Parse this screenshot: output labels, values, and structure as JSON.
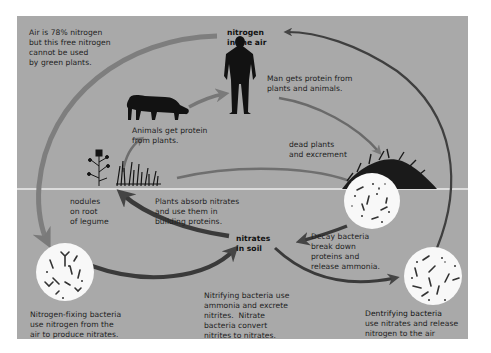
{
  "colors": {
    "panel_background": "#a9a9a9",
    "arrow_dark": "#4a4a4a",
    "arrow_light": "#7a7a7a",
    "silhouette": "#121212",
    "bacteria_circle": "#f8f8f8",
    "soil_line": "#eeeeee"
  },
  "nodes": {
    "nitrogen_air": {
      "label": "nitrogen\nin the air"
    },
    "nitrates_soil": {
      "label": "nitrates\nin soil"
    }
  },
  "annotations": {
    "air_fact": "Air is 78% nitrogen\nbut this free nitrogen\ncannot be used\nby green plants.",
    "man": "Man gets protein from\nplants and animals.",
    "animals": "Animals get protein\nfrom plants.",
    "dead_matter": "dead plants\nand excrement",
    "nodules": "nodules\non root\nof legume",
    "plants_absorb": "Plants absorb nitrates\nand use them in\nbuilding proteins.",
    "decay": "Decay bacteria\nbreak down\nproteins and\nrelease ammonia.",
    "nitrogen_fixing": "Nitrogen-fixing bacteria\nuse nitrogen from the\nair to produce nitrates.",
    "nitrifying": "Nitrifying bacteria use\nammonia and excrete\nnitrites.  Nitrate\nbacteria convert\nnitrites to nitrates.",
    "denitrifying_title": "Dentrifying bacteria",
    "denitrifying_body": "use nitrates and release\nnitrogen to the air"
  },
  "figures": {
    "man": "human-silhouette",
    "cow": "cow-silhouette",
    "legume": "legume-plant",
    "grass": "grass-plants",
    "mound": "decaying-matter-mound",
    "fixing_bacteria": "nitrogen-fixing-bacteria-circle",
    "decay_bacteria": "decay-bacteria-circle",
    "denitrifying_bacteria": "denitrifying-bacteria-circle"
  }
}
